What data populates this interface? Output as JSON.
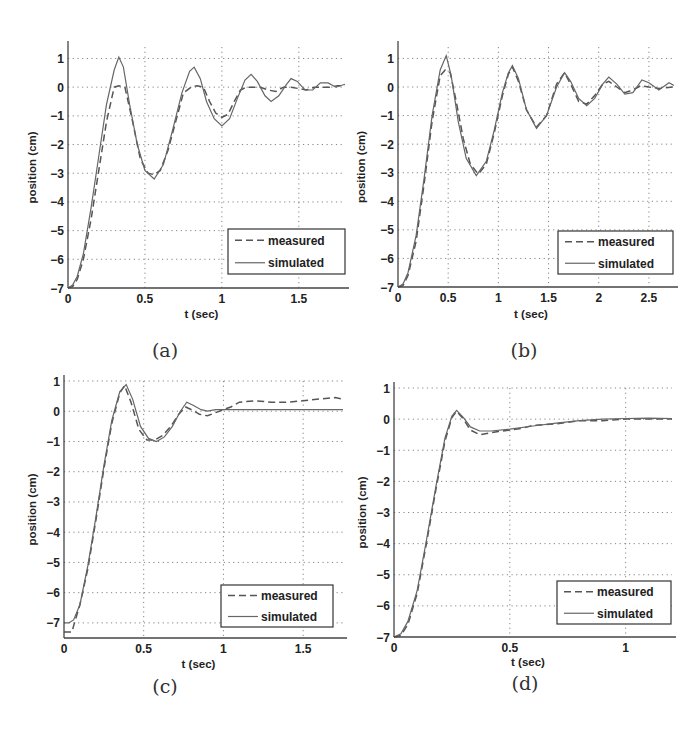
{
  "figure": {
    "background": "#ffffff",
    "line_color": "#555555"
  },
  "chart_data": [
    {
      "id": "a",
      "type": "line",
      "caption": "(a)",
      "title": "",
      "xlabel": "t (sec)",
      "ylabel": "position (cm)",
      "xlim": [
        0,
        1.8
      ],
      "ylim": [
        -7,
        1.4
      ],
      "xticks": [
        0,
        0.5,
        1,
        1.5
      ],
      "xtick_labels": [
        "0",
        "0.5",
        "1",
        "1.5"
      ],
      "yticks": [
        1,
        0,
        -1,
        -2,
        -3,
        -4,
        -5,
        -6,
        -7
      ],
      "ytick_labels": [
        "1",
        "0",
        "-1",
        "-2",
        "-3",
        "-4",
        "-5",
        "-6",
        "-7"
      ],
      "grid": true,
      "legend": {
        "position": "lower right",
        "entries": [
          "measured",
          "simulated"
        ]
      },
      "series": [
        {
          "name": "measured",
          "style": "dashed",
          "x": [
            0,
            0.03,
            0.06,
            0.1,
            0.15,
            0.2,
            0.25,
            0.3,
            0.33,
            0.37,
            0.42,
            0.47,
            0.52,
            0.56,
            0.6,
            0.65,
            0.7,
            0.75,
            0.8,
            0.84,
            0.88,
            0.92,
            0.96,
            1.0,
            1.04,
            1.08,
            1.12,
            1.16,
            1.2,
            1.25,
            1.3,
            1.35,
            1.4,
            1.45,
            1.5,
            1.55,
            1.6,
            1.65,
            1.7,
            1.75,
            1.8
          ],
          "y": [
            -7,
            -6.95,
            -6.7,
            -6.0,
            -4.6,
            -2.9,
            -1.2,
            0.0,
            0.05,
            0.0,
            -1.2,
            -2.5,
            -3.0,
            -3.05,
            -2.9,
            -2.2,
            -1.2,
            -0.2,
            0.0,
            0.05,
            0.0,
            -0.5,
            -0.9,
            -1.05,
            -0.95,
            -0.5,
            -0.1,
            0.0,
            0.0,
            0.0,
            -0.1,
            -0.15,
            0.0,
            0.0,
            -0.05,
            -0.1,
            0.0,
            0.0,
            0.0,
            0.05,
            0.05
          ]
        },
        {
          "name": "simulated",
          "style": "solid",
          "x": [
            0,
            0.03,
            0.06,
            0.1,
            0.15,
            0.2,
            0.25,
            0.3,
            0.33,
            0.36,
            0.4,
            0.45,
            0.5,
            0.56,
            0.62,
            0.68,
            0.74,
            0.79,
            0.82,
            0.86,
            0.9,
            0.95,
            1.0,
            1.05,
            1.1,
            1.15,
            1.19,
            1.23,
            1.28,
            1.32,
            1.37,
            1.42,
            1.45,
            1.49,
            1.54,
            1.59,
            1.64,
            1.69,
            1.74,
            1.8
          ],
          "y": [
            -7,
            -6.9,
            -6.6,
            -5.8,
            -4.2,
            -2.4,
            -0.6,
            0.6,
            1.05,
            0.7,
            -0.6,
            -2.0,
            -2.9,
            -3.2,
            -2.7,
            -1.5,
            -0.2,
            0.55,
            0.7,
            0.3,
            -0.5,
            -1.1,
            -1.35,
            -1.1,
            -0.4,
            0.25,
            0.45,
            0.2,
            -0.3,
            -0.5,
            -0.3,
            0.1,
            0.3,
            0.2,
            -0.1,
            -0.1,
            0.15,
            0.15,
            0.0,
            0.1
          ]
        }
      ]
    },
    {
      "id": "b",
      "type": "line",
      "caption": "(b)",
      "title": "",
      "xlabel": "t (sec)",
      "ylabel": "position (cm)",
      "xlim": [
        0,
        2.75
      ],
      "ylim": [
        -7,
        1.4
      ],
      "xticks": [
        0,
        0.5,
        1,
        1.5,
        2,
        2.5
      ],
      "xtick_labels": [
        "0",
        "0.5",
        "1",
        "1.5",
        "2",
        "2.5"
      ],
      "yticks": [
        1,
        0,
        -1,
        -2,
        -3,
        -4,
        -5,
        -6,
        -7
      ],
      "ytick_labels": [
        "1",
        "0",
        "-1",
        "-2",
        "-3",
        "-4",
        "-5",
        "-6",
        "-7"
      ],
      "grid": true,
      "legend": {
        "position": "lower right",
        "entries": [
          "measured",
          "simulated"
        ]
      },
      "series": [
        {
          "name": "measured",
          "style": "dashed",
          "x": [
            0,
            0.05,
            0.1,
            0.18,
            0.26,
            0.34,
            0.42,
            0.47,
            0.52,
            0.58,
            0.65,
            0.72,
            0.8,
            0.88,
            0.96,
            1.04,
            1.1,
            1.14,
            1.2,
            1.28,
            1.38,
            1.48,
            1.58,
            1.66,
            1.72,
            1.8,
            1.88,
            1.96,
            2.04,
            2.1,
            2.18,
            2.26,
            2.34,
            2.42,
            2.5,
            2.6,
            2.75
          ],
          "y": [
            -7,
            -6.95,
            -6.6,
            -5.4,
            -3.4,
            -1.2,
            0.4,
            0.6,
            0.5,
            -0.5,
            -1.8,
            -2.7,
            -3.05,
            -2.7,
            -1.6,
            -0.3,
            0.45,
            0.7,
            0.2,
            -0.8,
            -1.4,
            -1.0,
            0.1,
            0.5,
            0.1,
            -0.5,
            -0.6,
            -0.3,
            0.1,
            0.2,
            0.0,
            -0.2,
            -0.1,
            0.05,
            0.0,
            -0.05,
            0.0
          ]
        },
        {
          "name": "simulated",
          "style": "solid",
          "x": [
            0,
            0.05,
            0.1,
            0.18,
            0.26,
            0.34,
            0.42,
            0.48,
            0.53,
            0.6,
            0.68,
            0.78,
            0.88,
            0.96,
            1.04,
            1.1,
            1.14,
            1.2,
            1.28,
            1.38,
            1.48,
            1.58,
            1.66,
            1.72,
            1.8,
            1.88,
            1.96,
            2.04,
            2.1,
            2.18,
            2.26,
            2.34,
            2.43,
            2.5,
            2.6,
            2.7,
            2.75
          ],
          "y": [
            -7,
            -6.9,
            -6.5,
            -5.2,
            -3.2,
            -1.0,
            0.6,
            1.1,
            0.4,
            -1.2,
            -2.5,
            -3.1,
            -2.6,
            -1.5,
            -0.2,
            0.5,
            0.75,
            0.3,
            -0.8,
            -1.45,
            -1.0,
            0.0,
            0.5,
            0.2,
            -0.4,
            -0.65,
            -0.4,
            0.1,
            0.35,
            0.1,
            -0.25,
            -0.2,
            0.25,
            0.15,
            -0.1,
            0.15,
            0.05
          ]
        }
      ]
    },
    {
      "id": "c",
      "type": "line",
      "caption": "(c)",
      "title": "",
      "xlabel": "t (sec)",
      "ylabel": "position (cm)",
      "xlim": [
        0,
        1.75
      ],
      "ylim": [
        -7.5,
        1
      ],
      "xticks": [
        0,
        0.5,
        1,
        1.5
      ],
      "xtick_labels": [
        "0",
        "0.5",
        "1",
        "1.5"
      ],
      "yticks": [
        1,
        0,
        -1,
        -2,
        -3,
        -4,
        -5,
        -6,
        -7
      ],
      "ytick_labels": [
        "1",
        "0",
        "-1",
        "-2",
        "-3",
        "-4",
        "-5",
        "-6",
        "-7"
      ],
      "grid": true,
      "legend": {
        "position": "lower right",
        "entries": [
          "measured",
          "simulated"
        ]
      },
      "series": [
        {
          "name": "measured",
          "style": "dashed",
          "x": [
            0,
            0.05,
            0.06,
            0.1,
            0.15,
            0.2,
            0.25,
            0.3,
            0.35,
            0.38,
            0.42,
            0.47,
            0.52,
            0.57,
            0.62,
            0.67,
            0.72,
            0.76,
            0.8,
            0.85,
            0.9,
            0.95,
            1.0,
            1.05,
            1.1,
            1.2,
            1.3,
            1.4,
            1.5,
            1.6,
            1.7,
            1.75
          ],
          "y": [
            -7.3,
            -7.3,
            -7.1,
            -6.4,
            -5.2,
            -3.6,
            -1.9,
            -0.4,
            0.6,
            0.85,
            0.3,
            -0.6,
            -0.95,
            -0.95,
            -0.8,
            -0.5,
            -0.1,
            0.15,
            0.05,
            -0.1,
            -0.15,
            -0.05,
            0.05,
            0.15,
            0.3,
            0.35,
            0.3,
            0.3,
            0.35,
            0.4,
            0.45,
            0.4
          ]
        },
        {
          "name": "simulated",
          "style": "solid",
          "x": [
            0,
            0.03,
            0.06,
            0.1,
            0.15,
            0.2,
            0.25,
            0.3,
            0.35,
            0.39,
            0.43,
            0.48,
            0.53,
            0.58,
            0.63,
            0.68,
            0.73,
            0.77,
            0.81,
            0.86,
            0.9,
            0.95,
            1.0,
            1.2,
            1.4,
            1.6,
            1.75
          ],
          "y": [
            -7.0,
            -7.0,
            -6.9,
            -6.4,
            -5.1,
            -3.5,
            -1.8,
            -0.3,
            0.65,
            0.88,
            0.4,
            -0.5,
            -0.9,
            -1.0,
            -0.85,
            -0.5,
            0.0,
            0.3,
            0.2,
            0.05,
            0.0,
            0.05,
            0.05,
            0.05,
            0.05,
            0.05,
            0.05
          ]
        }
      ]
    },
    {
      "id": "d",
      "type": "line",
      "caption": "(d)",
      "title": "",
      "xlabel": "t (sec)",
      "ylabel": "position (cm)",
      "xlim": [
        0,
        1.2
      ],
      "ylim": [
        -7,
        1
      ],
      "xticks": [
        0,
        0.5,
        1
      ],
      "xtick_labels": [
        "0",
        "0.5",
        "1"
      ],
      "yticks": [
        1,
        0,
        -1,
        -2,
        -3,
        -4,
        -5,
        -6,
        -7
      ],
      "ytick_labels": [
        "1",
        "0",
        "-1",
        "-2",
        "-3",
        "-4",
        "-5",
        "-6",
        "-7"
      ],
      "grid": true,
      "legend": {
        "position": "lower right",
        "entries": [
          "measured",
          "simulated"
        ]
      },
      "series": [
        {
          "name": "measured",
          "style": "dashed",
          "x": [
            0,
            0.03,
            0.06,
            0.1,
            0.14,
            0.18,
            0.22,
            0.25,
            0.27,
            0.3,
            0.33,
            0.37,
            0.41,
            0.45,
            0.5,
            0.55,
            0.6,
            0.7,
            0.8,
            0.9,
            1.0,
            1.1,
            1.2
          ],
          "y": [
            -7,
            -6.95,
            -6.6,
            -5.6,
            -4.0,
            -2.3,
            -0.7,
            0.05,
            0.25,
            0.0,
            -0.35,
            -0.5,
            -0.45,
            -0.4,
            -0.35,
            -0.3,
            -0.2,
            -0.15,
            -0.05,
            -0.05,
            0.0,
            0.0,
            0.0
          ]
        },
        {
          "name": "simulated",
          "style": "solid",
          "x": [
            0,
            0.03,
            0.06,
            0.1,
            0.14,
            0.18,
            0.22,
            0.25,
            0.27,
            0.3,
            0.33,
            0.37,
            0.42,
            0.5,
            0.6,
            0.7,
            0.8,
            0.9,
            1.0,
            1.1,
            1.2
          ],
          "y": [
            -7,
            -6.9,
            -6.5,
            -5.5,
            -3.9,
            -2.2,
            -0.6,
            0.1,
            0.28,
            0.05,
            -0.25,
            -0.38,
            -0.38,
            -0.32,
            -0.22,
            -0.13,
            -0.05,
            0.0,
            0.02,
            0.03,
            0.02
          ]
        }
      ]
    }
  ]
}
